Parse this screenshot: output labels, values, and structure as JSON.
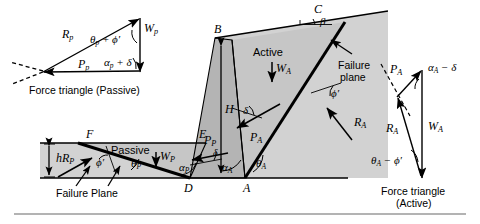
{
  "figure": {
    "colors": {
      "soil_fill": "#d2d2d2",
      "wedge_fill": "#c6c6c6",
      "wall_fill": "#b4b4b4",
      "line": "#000000",
      "background": "#ffffff",
      "rule": "#808080"
    }
  },
  "left_triangle": {
    "caption": "Force triangle (Passive)",
    "vectors": {
      "Rp": "R",
      "Rp_sub": "p",
      "Pp": "P",
      "Pp_sub": "p",
      "Wp": "W",
      "Wp_sub": "p"
    },
    "angles": {
      "top": "θ",
      "top_sub": "p",
      "top_rest": " + ϕ′",
      "bottom": "α",
      "bottom_sub": "p",
      "bottom_rest": " + δ"
    }
  },
  "right_triangle": {
    "caption_line1": "Force triangle",
    "caption_line2": "(Active)",
    "vectors": {
      "Pa": "P",
      "Pa_sub": "A",
      "Ra": "R",
      "Ra_sub": "A",
      "Wa": "W",
      "Wa_sub": "A"
    },
    "angles": {
      "top": "α",
      "top_sub": "A",
      "top_rest": " − δ",
      "bottom": "θ",
      "bottom_sub": "A",
      "bottom_rest": " − ϕ′"
    }
  },
  "main": {
    "points": {
      "A": "A",
      "B": "B",
      "C": "C",
      "D": "D",
      "E": "E",
      "F": "F"
    },
    "labels": {
      "active": "Active",
      "passive": "Passive",
      "failure_plane_right_l1": "Failure",
      "failure_plane_right_l2": "plane",
      "failure_plane_left": "Failure Plane",
      "height_H": "H",
      "height_h": "h",
      "beta": "β"
    },
    "forces": {
      "Wa": "W",
      "Wa_sub": "A",
      "Wp": "W",
      "Wp_sub": "P",
      "Pa": "P",
      "Pa_sub": "A",
      "Pp": "P",
      "Pp_sub": "P",
      "Ra": "R",
      "Ra_sub": "A",
      "Rp": "R",
      "Rp_sub": "P"
    },
    "angles": {
      "alpha_a": "α",
      "alpha_a_sub": "A",
      "alpha_p": "α",
      "alpha_p_sub": "P",
      "theta_a": "θ",
      "theta_a_sub": "A",
      "theta_p": "θ",
      "theta_p_sub": "P",
      "delta_a": "δ",
      "delta_p": "δ",
      "phi_a": "ϕ′",
      "phi_p": "ϕ′"
    }
  }
}
